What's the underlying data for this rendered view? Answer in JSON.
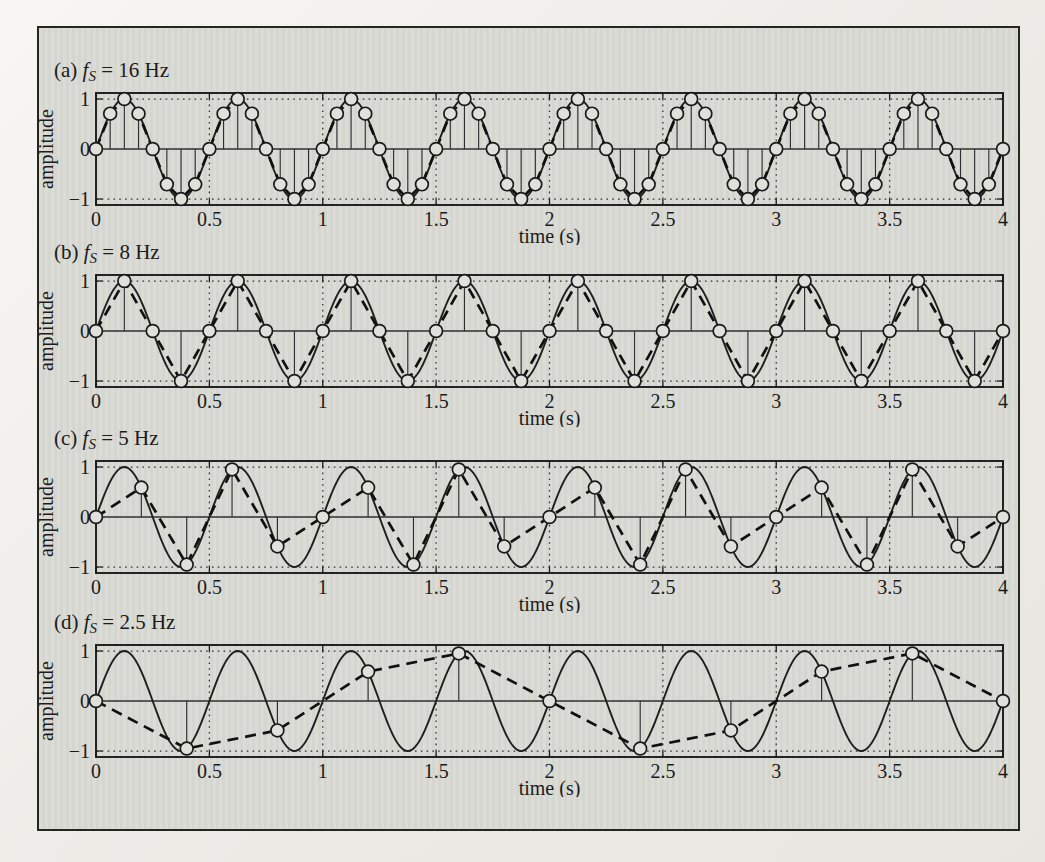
{
  "colors": {
    "paper_outer": "#efeee9",
    "paper_inner": "#d9dad4",
    "ink": "#1b1b1b",
    "grid_ink": "#2f2f2f",
    "curve_ink": "#1f1f1f",
    "dashed_ink": "#111111",
    "marker_fill": "#e0e1db",
    "marker_stroke": "#1a1a1a"
  },
  "chart_data": [
    {
      "type": "line",
      "panel_index": "(a)",
      "title_text": "(a) fS = 16 Hz",
      "title_parts": {
        "prefix": "(a) ",
        "symbol": "f",
        "subscript": "S",
        "rest": " = 16 Hz"
      },
      "sampling_frequency_hz": 16,
      "signal": {
        "shape": "sine",
        "frequency_hz": 2,
        "amplitude": 1,
        "phase": 0
      },
      "xlabel": "time (s)",
      "ylabel": "amplitude",
      "xlim": [
        0,
        4
      ],
      "ylim": [
        -1,
        1
      ],
      "xticks": [
        0,
        0.5,
        1,
        1.5,
        2,
        2.5,
        3,
        3.5,
        4
      ],
      "xtick_labels": [
        "0",
        "0.5",
        "1",
        "1.5",
        "2",
        "2.5",
        "3",
        "3.5",
        "4"
      ],
      "yticks": [
        1,
        0,
        -1
      ],
      "ytick_labels": [
        "1",
        "0",
        "−1"
      ],
      "grid": "dotted vertical lines at xticks; dotted horizontal lines at amplitude ±1",
      "legend": "none",
      "series_styles": [
        "solid sine curve",
        "dashed linear interpolation through samples",
        "stems with open circle markers"
      ],
      "samples": {
        "t": [
          0,
          0.0625,
          0.125,
          0.1875,
          0.25,
          0.3125,
          0.375,
          0.4375,
          0.5,
          0.5625,
          0.625,
          0.6875,
          0.75,
          0.8125,
          0.875,
          0.9375,
          1,
          1.0625,
          1.125,
          1.1875,
          1.25,
          1.3125,
          1.375,
          1.4375,
          1.5,
          1.5625,
          1.625,
          1.6875,
          1.75,
          1.8125,
          1.875,
          1.9375,
          2,
          2.0625,
          2.125,
          2.1875,
          2.25,
          2.3125,
          2.375,
          2.4375,
          2.5,
          2.5625,
          2.625,
          2.6875,
          2.75,
          2.8125,
          2.875,
          2.9375,
          3,
          3.0625,
          3.125,
          3.1875,
          3.25,
          3.3125,
          3.375,
          3.4375,
          3.5,
          3.5625,
          3.625,
          3.6875,
          3.75,
          3.8125,
          3.875,
          3.9375,
          4
        ],
        "y": [
          0,
          0.707,
          1,
          0.707,
          0,
          -0.707,
          -1,
          -0.707,
          0,
          0.707,
          1,
          0.707,
          0,
          -0.707,
          -1,
          -0.707,
          0,
          0.707,
          1,
          0.707,
          0,
          -0.707,
          -1,
          -0.707,
          0,
          0.707,
          1,
          0.707,
          0,
          -0.707,
          -1,
          -0.707,
          0,
          0.707,
          1,
          0.707,
          0,
          -0.707,
          -1,
          -0.707,
          0,
          0.707,
          1,
          0.707,
          0,
          -0.707,
          -1,
          -0.707,
          0,
          0.707,
          1,
          0.707,
          0,
          -0.707,
          -1,
          -0.707,
          0,
          0.707,
          1,
          0.707,
          0,
          -0.707,
          -1,
          -0.707,
          0
        ]
      }
    },
    {
      "type": "line",
      "panel_index": "(b)",
      "title_text": "(b) fS = 8 Hz",
      "title_parts": {
        "prefix": "(b) ",
        "symbol": "f",
        "subscript": "S",
        "rest": " = 8 Hz"
      },
      "sampling_frequency_hz": 8,
      "signal": {
        "shape": "sine",
        "frequency_hz": 2,
        "amplitude": 1,
        "phase": 0
      },
      "xlabel": "time (s)",
      "ylabel": "amplitude",
      "xlim": [
        0,
        4
      ],
      "ylim": [
        -1,
        1
      ],
      "xticks": [
        0,
        0.5,
        1,
        1.5,
        2,
        2.5,
        3,
        3.5,
        4
      ],
      "xtick_labels": [
        "0",
        "0.5",
        "1",
        "1.5",
        "2",
        "2.5",
        "3",
        "3.5",
        "4"
      ],
      "yticks": [
        1,
        0,
        -1
      ],
      "ytick_labels": [
        "1",
        "0",
        "−1"
      ],
      "grid": "dotted vertical lines at xticks; dotted horizontal lines at amplitude ±1",
      "legend": "none",
      "series_styles": [
        "solid sine curve",
        "dashed linear interpolation through samples",
        "stems with open circle markers"
      ],
      "samples": {
        "t": [
          0,
          0.125,
          0.25,
          0.375,
          0.5,
          0.625,
          0.75,
          0.875,
          1,
          1.125,
          1.25,
          1.375,
          1.5,
          1.625,
          1.75,
          1.875,
          2,
          2.125,
          2.25,
          2.375,
          2.5,
          2.625,
          2.75,
          2.875,
          3,
          3.125,
          3.25,
          3.375,
          3.5,
          3.625,
          3.75,
          3.875,
          4
        ],
        "y": [
          0,
          1,
          0,
          -1,
          0,
          1,
          0,
          -1,
          0,
          1,
          0,
          -1,
          0,
          1,
          0,
          -1,
          0,
          1,
          0,
          -1,
          0,
          1,
          0,
          -1,
          0,
          1,
          0,
          -1,
          0,
          1,
          0,
          -1,
          0
        ]
      }
    },
    {
      "type": "line",
      "panel_index": "(c)",
      "title_text": "(c) fS = 5 Hz",
      "title_parts": {
        "prefix": "(c) ",
        "symbol": "f",
        "subscript": "S",
        "rest": " = 5 Hz"
      },
      "sampling_frequency_hz": 5,
      "signal": {
        "shape": "sine",
        "frequency_hz": 2,
        "amplitude": 1,
        "phase": 0
      },
      "xlabel": "time (s)",
      "ylabel": "amplitude",
      "xlim": [
        0,
        4
      ],
      "ylim": [
        -1,
        1
      ],
      "xticks": [
        0,
        0.5,
        1,
        1.5,
        2,
        2.5,
        3,
        3.5,
        4
      ],
      "xtick_labels": [
        "0",
        "0.5",
        "1",
        "1.5",
        "2",
        "2.5",
        "3",
        "3.5",
        "4"
      ],
      "yticks": [
        1,
        0,
        -1
      ],
      "ytick_labels": [
        "1",
        "0",
        "−1"
      ],
      "grid": "dotted vertical lines at xticks; dotted horizontal lines at amplitude ±1",
      "legend": "none",
      "series_styles": [
        "solid sine curve",
        "dashed linear interpolation through samples",
        "stems with open circle markers"
      ],
      "samples": {
        "t": [
          0,
          0.2,
          0.4,
          0.6,
          0.8,
          1,
          1.2,
          1.4,
          1.6,
          1.8,
          2,
          2.2,
          2.4,
          2.6,
          2.8,
          3,
          3.2,
          3.4,
          3.6,
          3.8,
          4
        ],
        "y": [
          0,
          0.588,
          -0.951,
          0.951,
          -0.588,
          0,
          0.588,
          -0.951,
          0.951,
          -0.588,
          0,
          0.588,
          -0.951,
          0.951,
          -0.588,
          0,
          0.588,
          -0.951,
          0.951,
          -0.588,
          0
        ]
      }
    },
    {
      "type": "line",
      "panel_index": "(d)",
      "title_text": "(d) fS = 2.5 Hz",
      "title_parts": {
        "prefix": "(d) ",
        "symbol": "f",
        "subscript": "S",
        "rest": " = 2.5 Hz"
      },
      "sampling_frequency_hz": 2.5,
      "signal": {
        "shape": "sine",
        "frequency_hz": 2,
        "amplitude": 1,
        "phase": 0
      },
      "xlabel": "time (s)",
      "ylabel": "amplitude",
      "xlim": [
        0,
        4
      ],
      "ylim": [
        -1,
        1
      ],
      "xticks": [
        0,
        0.5,
        1,
        1.5,
        2,
        2.5,
        3,
        3.5,
        4
      ],
      "xtick_labels": [
        "0",
        "0.5",
        "1",
        "1.5",
        "2",
        "2.5",
        "3",
        "3.5",
        "4"
      ],
      "yticks": [
        1,
        0,
        -1
      ],
      "ytick_labels": [
        "1",
        "0",
        "−1"
      ],
      "grid": "dotted vertical lines at xticks; dotted horizontal lines at amplitude ±1",
      "legend": "none",
      "series_styles": [
        "solid sine curve",
        "dashed linear interpolation through samples",
        "stems with open circle markers"
      ],
      "samples": {
        "t": [
          0,
          0.4,
          0.8,
          1.2,
          1.6,
          2,
          2.4,
          2.8,
          3.2,
          3.6,
          4
        ],
        "y": [
          0,
          -0.951,
          -0.588,
          0.588,
          0.951,
          0,
          -0.951,
          -0.588,
          0.588,
          0.951,
          0
        ]
      }
    }
  ]
}
